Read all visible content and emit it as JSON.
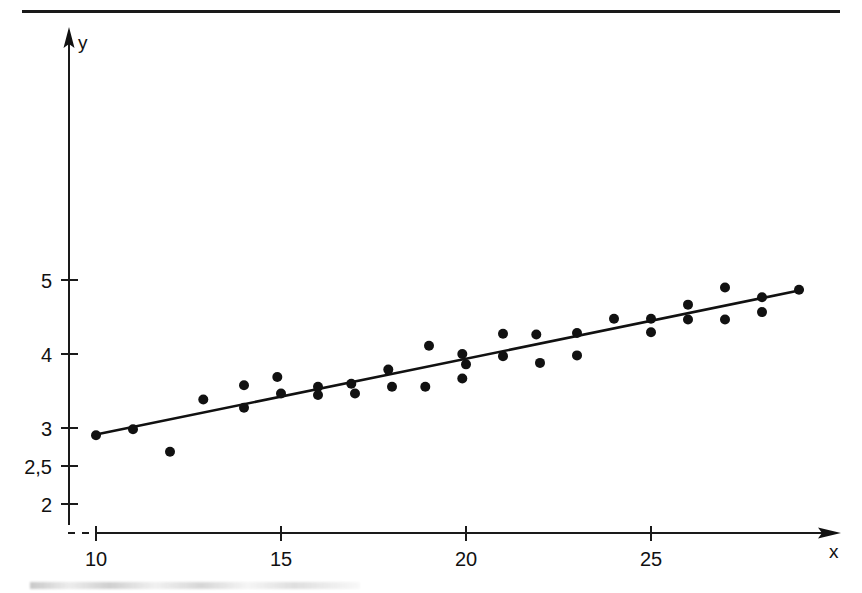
{
  "chart_data": {
    "type": "scatter",
    "title": "",
    "subtitle": "",
    "xlabel": "x",
    "ylabel": "y",
    "xlim": [
      9.2,
      30.4
    ],
    "ylim": [
      1.72,
      6.45
    ],
    "grid": false,
    "legend": null,
    "x_ticks": [
      10,
      15,
      20,
      25
    ],
    "x_tick_labels": [
      "10",
      "15",
      "20",
      "25"
    ],
    "y_ticks": [
      2,
      2.5,
      3,
      4,
      5
    ],
    "y_tick_labels": [
      "2",
      "2,5",
      "3",
      "4",
      "5"
    ],
    "axis_arrows": true,
    "axis_break": true,
    "marker": "filled-circle",
    "marker_color": "#111111",
    "line_color": "#111111",
    "points": [
      {
        "x": 10.0,
        "y": 2.92
      },
      {
        "x": 11.0,
        "y": 3.0
      },
      {
        "x": 12.0,
        "y": 2.7
      },
      {
        "x": 12.9,
        "y": 3.4
      },
      {
        "x": 14.0,
        "y": 3.59
      },
      {
        "x": 14.0,
        "y": 3.29
      },
      {
        "x": 14.9,
        "y": 3.7
      },
      {
        "x": 15.0,
        "y": 3.48
      },
      {
        "x": 16.0,
        "y": 3.57
      },
      {
        "x": 16.0,
        "y": 3.46
      },
      {
        "x": 16.9,
        "y": 3.61
      },
      {
        "x": 17.0,
        "y": 3.48
      },
      {
        "x": 17.9,
        "y": 3.8
      },
      {
        "x": 18.0,
        "y": 3.57
      },
      {
        "x": 19.0,
        "y": 4.12
      },
      {
        "x": 18.9,
        "y": 3.57
      },
      {
        "x": 19.9,
        "y": 4.01
      },
      {
        "x": 20.0,
        "y": 3.87
      },
      {
        "x": 19.9,
        "y": 3.68
      },
      {
        "x": 21.0,
        "y": 4.28
      },
      {
        "x": 21.0,
        "y": 3.98
      },
      {
        "x": 21.9,
        "y": 4.27
      },
      {
        "x": 22.0,
        "y": 3.89
      },
      {
        "x": 23.0,
        "y": 4.29
      },
      {
        "x": 23.0,
        "y": 3.99
      },
      {
        "x": 24.0,
        "y": 4.48
      },
      {
        "x": 25.0,
        "y": 4.48
      },
      {
        "x": 25.0,
        "y": 4.3
      },
      {
        "x": 26.0,
        "y": 4.67
      },
      {
        "x": 26.0,
        "y": 4.47
      },
      {
        "x": 27.0,
        "y": 4.9
      },
      {
        "x": 27.0,
        "y": 4.47
      },
      {
        "x": 28.0,
        "y": 4.77
      },
      {
        "x": 28.0,
        "y": 4.57
      },
      {
        "x": 29.0,
        "y": 4.87
      }
    ],
    "fit_line": {
      "label": "regression line",
      "x_start": 10.0,
      "y_start": 2.93,
      "x_end": 29.1,
      "y_end": 4.87
    }
  },
  "figure": {
    "top_rule_present": true,
    "background_color": "#ffffff",
    "ink_color": "#111111"
  }
}
